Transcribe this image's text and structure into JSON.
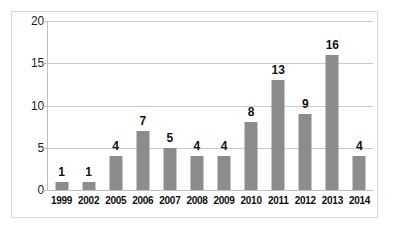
{
  "chart_data": {
    "type": "bar",
    "title": "",
    "subtitle": "",
    "xlabel": "",
    "ylabel": "",
    "categories": [
      "1999",
      "2002",
      "2005",
      "2006",
      "2007",
      "2008",
      "2009",
      "2010",
      "2011",
      "2012",
      "2013",
      "2014"
    ],
    "values": [
      1,
      1,
      4,
      7,
      5,
      4,
      4,
      8,
      13,
      9,
      16,
      4
    ],
    "data_labels": [
      "1",
      "1",
      "4",
      "7",
      "5",
      "4",
      "4",
      "8",
      "13",
      "9",
      "16",
      "4"
    ],
    "ylim": [
      0,
      20
    ],
    "y_ticks": [
      0,
      5,
      10,
      15,
      20
    ],
    "y_tick_labels": [
      "0",
      "5",
      "10",
      "15",
      "20"
    ],
    "grid": true,
    "grid_axis": "y",
    "legend": false,
    "legend_position": "none",
    "show_data_labels": true,
    "colors": {
      "bar": "#8c8c8c",
      "gridline": "#c9c9c9",
      "axis_line": "#bfbfbf",
      "frame": "#d6d6d6",
      "background": "#ffffff",
      "label_text": "#101010",
      "tick_text": "#1a1a1a"
    }
  }
}
